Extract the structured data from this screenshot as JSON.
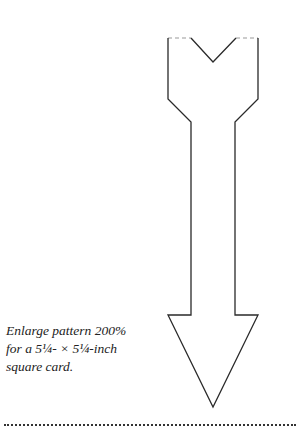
{
  "caption": {
    "line1": "Enlarge pattern 200%",
    "line2": "for a 5¼- × 5¼-inch",
    "line3": "square card."
  },
  "pattern": {
    "shape": "arrow-pointing-down",
    "stroke_color": "#2a2a2a",
    "fold_line_color": "#999999"
  }
}
